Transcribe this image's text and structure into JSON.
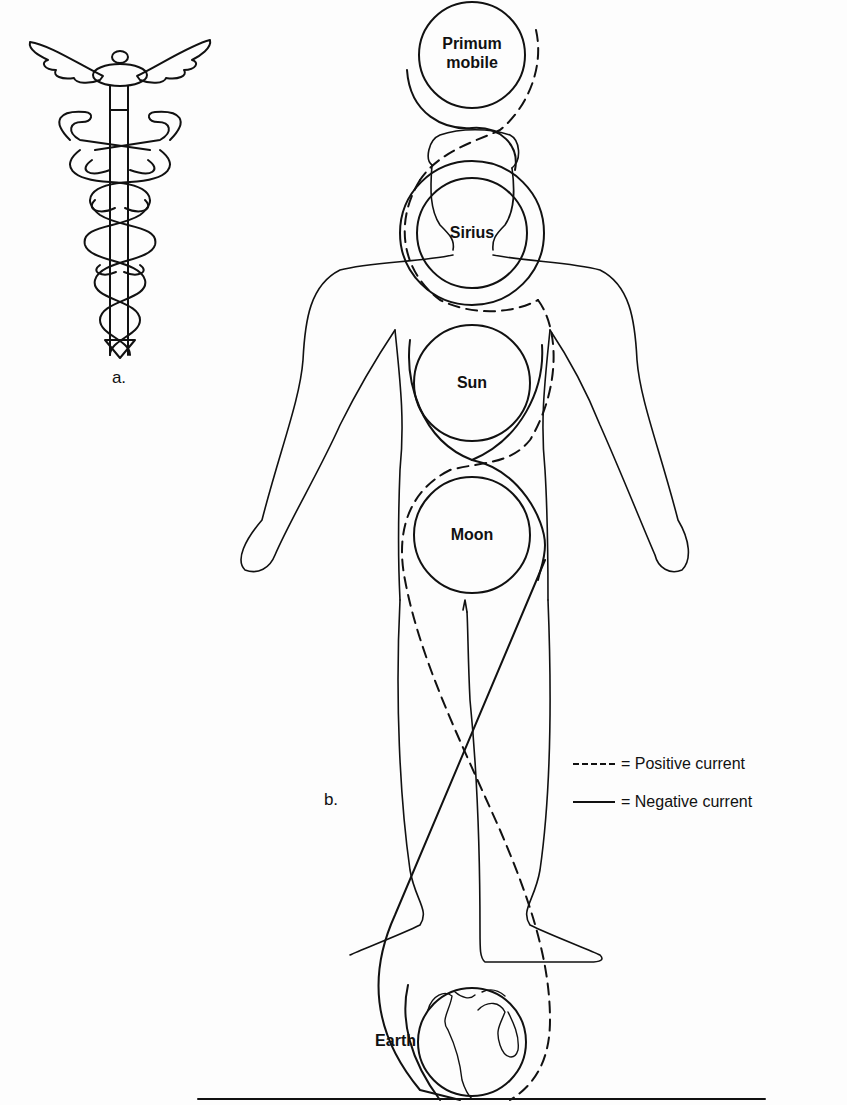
{
  "figure": {
    "panel_a": {
      "label": "a.",
      "subject": "caduceus-icon"
    },
    "panel_b": {
      "label": "b.",
      "subject": "human-figure-with-celestial-spheres"
    },
    "spheres": [
      {
        "name": "Primum mobile",
        "line1": "Primum",
        "line2": "mobile"
      },
      {
        "name": "Sirius"
      },
      {
        "name": "Sun"
      },
      {
        "name": "Moon"
      },
      {
        "name": "Earth"
      }
    ],
    "legend": [
      {
        "symbol": "dashed-line",
        "text": "= Positive current"
      },
      {
        "symbol": "solid-line",
        "text": "= Negative current"
      }
    ],
    "colors": {
      "ink": "#111111",
      "paper": "#fdfdfd"
    }
  }
}
